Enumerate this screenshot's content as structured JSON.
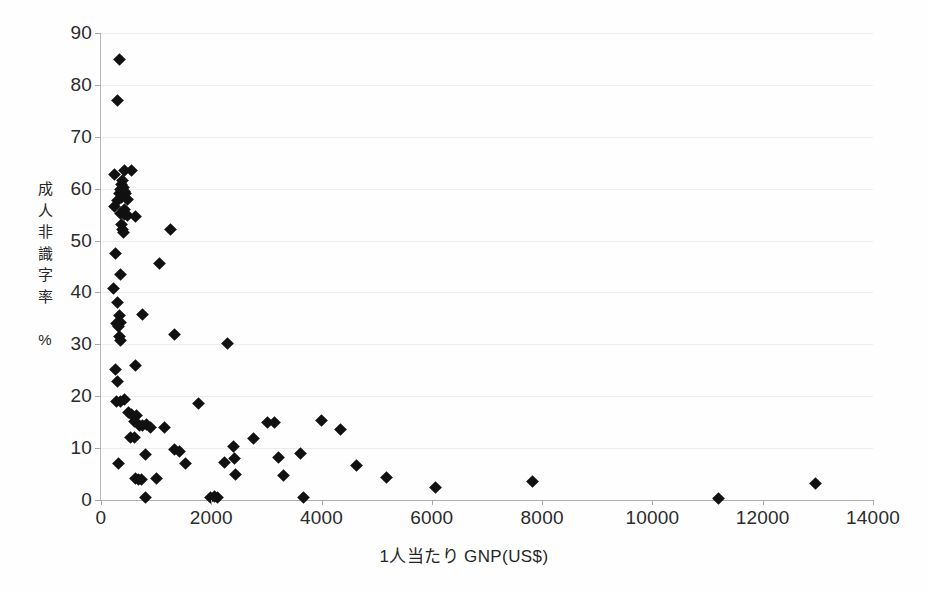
{
  "chart_data": {
    "type": "scatter",
    "title": "",
    "xlabel": "1人当たり GNP(US$)",
    "ylabel": "成人非識字率 %",
    "ylabel_chars": "成\n人\n非\n識\n字\n率\n\n%",
    "xlim": [
      0,
      14000
    ],
    "ylim": [
      0,
      90
    ],
    "xticks": [
      0,
      2000,
      4000,
      6000,
      8000,
      10000,
      12000,
      14000
    ],
    "yticks": [
      0,
      10,
      20,
      30,
      40,
      50,
      60,
      70,
      80,
      90
    ],
    "xtick_labels": [
      "0",
      "2000",
      "4000",
      "6000",
      "8000",
      "10000",
      "12000",
      "14000"
    ],
    "ytick_labels": [
      "0",
      "10",
      "20",
      "30",
      "40",
      "50",
      "60",
      "70",
      "80",
      "90"
    ],
    "grid": "horizontal-faint",
    "legend": "none",
    "marker": "filled-diamond",
    "marker_color": "#111111",
    "series": [
      {
        "name": "countries",
        "points": [
          [
            330,
            84.8
          ],
          [
            300,
            77.0
          ],
          [
            250,
            62.8
          ],
          [
            420,
            63.5
          ],
          [
            560,
            63.5
          ],
          [
            390,
            61.5
          ],
          [
            370,
            60.8
          ],
          [
            400,
            60.2
          ],
          [
            350,
            59.8
          ],
          [
            420,
            59.5
          ],
          [
            330,
            59.0
          ],
          [
            450,
            59.0
          ],
          [
            370,
            58.3
          ],
          [
            300,
            57.8
          ],
          [
            480,
            58.0
          ],
          [
            250,
            56.5
          ],
          [
            420,
            56.0
          ],
          [
            360,
            55.2
          ],
          [
            420,
            55.0
          ],
          [
            480,
            54.8
          ],
          [
            620,
            54.6
          ],
          [
            380,
            53.0
          ],
          [
            390,
            52.2
          ],
          [
            400,
            51.5
          ],
          [
            1260,
            52.2
          ],
          [
            270,
            47.5
          ],
          [
            1060,
            45.6
          ],
          [
            230,
            40.8
          ],
          [
            350,
            43.5
          ],
          [
            300,
            38.0
          ],
          [
            330,
            35.5
          ],
          [
            350,
            34.2
          ],
          [
            290,
            34.0
          ],
          [
            310,
            33.5
          ],
          [
            760,
            35.8
          ],
          [
            330,
            31.6
          ],
          [
            350,
            30.8
          ],
          [
            1330,
            31.9
          ],
          [
            2290,
            30.2
          ],
          [
            260,
            25.2
          ],
          [
            300,
            22.8
          ],
          [
            620,
            26.0
          ],
          [
            280,
            19.0
          ],
          [
            350,
            19.0
          ],
          [
            420,
            19.3
          ],
          [
            1760,
            18.6
          ],
          [
            500,
            16.8
          ],
          [
            560,
            16.5
          ],
          [
            640,
            16.2
          ],
          [
            610,
            15.2
          ],
          [
            700,
            14.3
          ],
          [
            750,
            14.3
          ],
          [
            820,
            14.5
          ],
          [
            900,
            13.9
          ],
          [
            1160,
            14.0
          ],
          [
            3020,
            14.9
          ],
          [
            3140,
            15.0
          ],
          [
            4000,
            15.4
          ],
          [
            4350,
            13.6
          ],
          [
            2760,
            11.8
          ],
          [
            530,
            12.0
          ],
          [
            600,
            12.0
          ],
          [
            1330,
            9.8
          ],
          [
            1420,
            9.4
          ],
          [
            2400,
            10.3
          ],
          [
            2430,
            8.0
          ],
          [
            3620,
            8.9
          ],
          [
            3220,
            8.2
          ],
          [
            800,
            8.8
          ],
          [
            320,
            7.0
          ],
          [
            1530,
            7.0
          ],
          [
            2240,
            7.2
          ],
          [
            2440,
            4.9
          ],
          [
            3310,
            4.7
          ],
          [
            4630,
            6.7
          ],
          [
            5180,
            4.4
          ],
          [
            620,
            4.1
          ],
          [
            680,
            4.0
          ],
          [
            730,
            4.0
          ],
          [
            1000,
            4.2
          ],
          [
            6060,
            2.4
          ],
          [
            7830,
            3.5
          ],
          [
            12950,
            3.1
          ],
          [
            11190,
            0.3
          ],
          [
            800,
            0.5
          ],
          [
            1980,
            0.5
          ],
          [
            2120,
            0.5
          ],
          [
            3680,
            0.4
          ],
          [
            2050,
            0.6
          ]
        ]
      }
    ]
  },
  "axis": {
    "y_title_lines": [
      "成",
      "人",
      "非",
      "識",
      "字",
      "率",
      "",
      "%"
    ],
    "x_title": "1人当たり GNP(US$)"
  }
}
